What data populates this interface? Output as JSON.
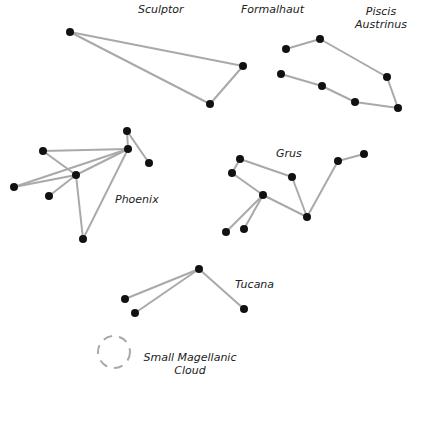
{
  "colors": {
    "line": "#a9a9a9",
    "star": "#111111",
    "text": "#222222",
    "cloud": "#a9a9a9"
  },
  "constellations": [
    {
      "name": "Sculptor",
      "label_pos": [
        138,
        3
      ],
      "stars": [
        [
          70,
          32
        ],
        [
          243,
          66
        ],
        [
          210,
          104
        ]
      ],
      "edges": [
        [
          0,
          1
        ],
        [
          1,
          2
        ],
        [
          2,
          0
        ]
      ]
    },
    {
      "name": "Formalhaut",
      "label_pos": [
        241,
        3
      ],
      "stars": [],
      "edges": []
    },
    {
      "name": "Piscis Austrinus",
      "label_pos": [
        354,
        5
      ],
      "stars": [
        [
          286,
          49
        ],
        [
          320,
          39
        ],
        [
          387,
          77
        ],
        [
          281,
          74
        ],
        [
          322,
          86
        ],
        [
          355,
          102
        ],
        [
          398,
          108
        ]
      ],
      "edges": [
        [
          0,
          1
        ],
        [
          1,
          2
        ],
        [
          2,
          6
        ],
        [
          3,
          4
        ],
        [
          4,
          5
        ],
        [
          5,
          6
        ]
      ]
    },
    {
      "name": "Phoenix",
      "label_pos": [
        115,
        193
      ],
      "stars": [
        [
          127,
          131
        ],
        [
          128,
          149
        ],
        [
          149,
          163
        ],
        [
          43,
          151
        ],
        [
          76,
          175
        ],
        [
          14,
          187
        ],
        [
          49,
          196
        ],
        [
          83,
          239
        ]
      ],
      "edges": [
        [
          0,
          1
        ],
        [
          0,
          2
        ],
        [
          1,
          3
        ],
        [
          3,
          4
        ],
        [
          1,
          4
        ],
        [
          4,
          5
        ],
        [
          5,
          1
        ],
        [
          4,
          6
        ],
        [
          4,
          7
        ],
        [
          7,
          1
        ]
      ]
    },
    {
      "name": "Grus",
      "label_pos": [
        276,
        147
      ],
      "stars": [
        [
          240,
          159
        ],
        [
          232,
          173
        ],
        [
          292,
          177
        ],
        [
          263,
          195
        ],
        [
          307,
          217
        ],
        [
          338,
          161
        ],
        [
          364,
          154
        ],
        [
          226,
          232
        ],
        [
          244,
          229
        ]
      ],
      "edges": [
        [
          0,
          1
        ],
        [
          0,
          2
        ],
        [
          2,
          4
        ],
        [
          1,
          3
        ],
        [
          3,
          4
        ],
        [
          4,
          5
        ],
        [
          5,
          6
        ],
        [
          3,
          7
        ],
        [
          3,
          8
        ]
      ]
    },
    {
      "name": "Tucana",
      "label_pos": [
        235,
        278
      ],
      "stars": [
        [
          199,
          269
        ],
        [
          125,
          299
        ],
        [
          135,
          313
        ],
        [
          244,
          309
        ]
      ],
      "edges": [
        [
          0,
          1
        ],
        [
          0,
          2
        ],
        [
          0,
          3
        ]
      ]
    }
  ],
  "labels": {
    "sculptor": "Sculptor",
    "formalhaut": "Formalhaut",
    "piscis_line1": "Piscis",
    "piscis_line2": "Austrinus",
    "phoenix": "Phoenix",
    "grus": "Grus",
    "tucana": "Tucana",
    "smc_line1": "Small Magellanic",
    "smc_line2": "Cloud"
  },
  "smc": {
    "cx": 114,
    "cy": 352,
    "r": 16
  }
}
